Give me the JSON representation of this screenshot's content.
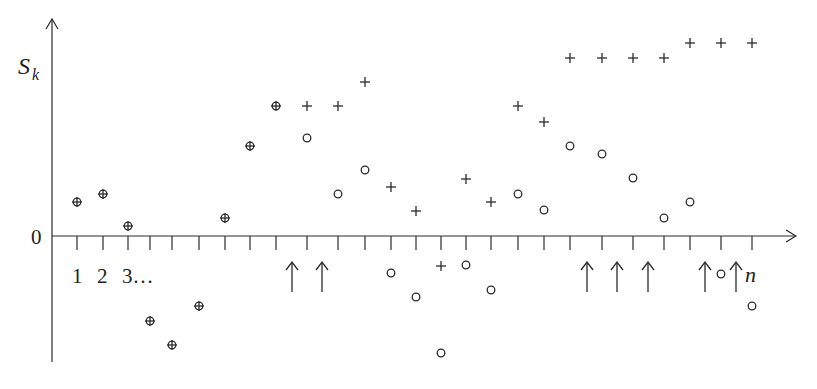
{
  "labels": {
    "y_axis": "S",
    "y_axis_sub": "k",
    "origin": "0",
    "x_ticks_start": [
      "1",
      "2",
      "3…"
    ],
    "x_end": "n"
  },
  "colors": {
    "ink": "#2a2a2a",
    "background": "#ffffff"
  },
  "chart_data": {
    "type": "scatter",
    "title": "",
    "xlabel": "",
    "ylabel": "S_k",
    "tick_pixels": [
      77,
      103,
      128,
      150,
      172,
      199,
      225,
      250,
      276,
      307,
      338,
      365,
      391,
      416,
      441,
      466,
      491,
      518,
      544,
      570,
      602,
      633,
      664,
      690,
      721,
      752
    ],
    "series": [
      {
        "name": "plus",
        "marker": "+",
        "points_px": [
          [
            77,
            202
          ],
          [
            103,
            194
          ],
          [
            128,
            226
          ],
          [
            150,
            321
          ],
          [
            172,
            345
          ],
          [
            199,
            306
          ],
          [
            225,
            218
          ],
          [
            250,
            146
          ],
          [
            276,
            106
          ],
          [
            307,
            106
          ],
          [
            338,
            106
          ],
          [
            365,
            82
          ],
          [
            391,
            187
          ],
          [
            416,
            211
          ],
          [
            441,
            266
          ],
          [
            466,
            179
          ],
          [
            491,
            202
          ],
          [
            518,
            106
          ],
          [
            544,
            122
          ],
          [
            570,
            58
          ],
          [
            602,
            58
          ],
          [
            633,
            58
          ],
          [
            664,
            58
          ],
          [
            690,
            43
          ],
          [
            721,
            43
          ],
          [
            752,
            43
          ]
        ]
      },
      {
        "name": "circle",
        "marker": "o",
        "points_px": [
          [
            77,
            202
          ],
          [
            103,
            194
          ],
          [
            128,
            226
          ],
          [
            150,
            321
          ],
          [
            172,
            345
          ],
          [
            199,
            306
          ],
          [
            225,
            218
          ],
          [
            250,
            146
          ],
          [
            276,
            106
          ],
          [
            307,
            138
          ],
          [
            338,
            194
          ],
          [
            365,
            170
          ],
          [
            391,
            273
          ],
          [
            416,
            297
          ],
          [
            441,
            353
          ],
          [
            466,
            265
          ],
          [
            491,
            290
          ],
          [
            518,
            194
          ],
          [
            544,
            210
          ],
          [
            570,
            146
          ],
          [
            602,
            154
          ],
          [
            633,
            178
          ],
          [
            664,
            218
          ],
          [
            690,
            202
          ],
          [
            721,
            274
          ],
          [
            752,
            306
          ]
        ]
      }
    ],
    "arrows_x_px": [
      292,
      322,
      587,
      617,
      648,
      705,
      736
    ],
    "axes": {
      "origin_px": [
        52,
        236
      ],
      "x_end_px": 795,
      "y_top_px": 18,
      "y_bottom_px": 362
    },
    "grid": false,
    "legend": "none"
  }
}
